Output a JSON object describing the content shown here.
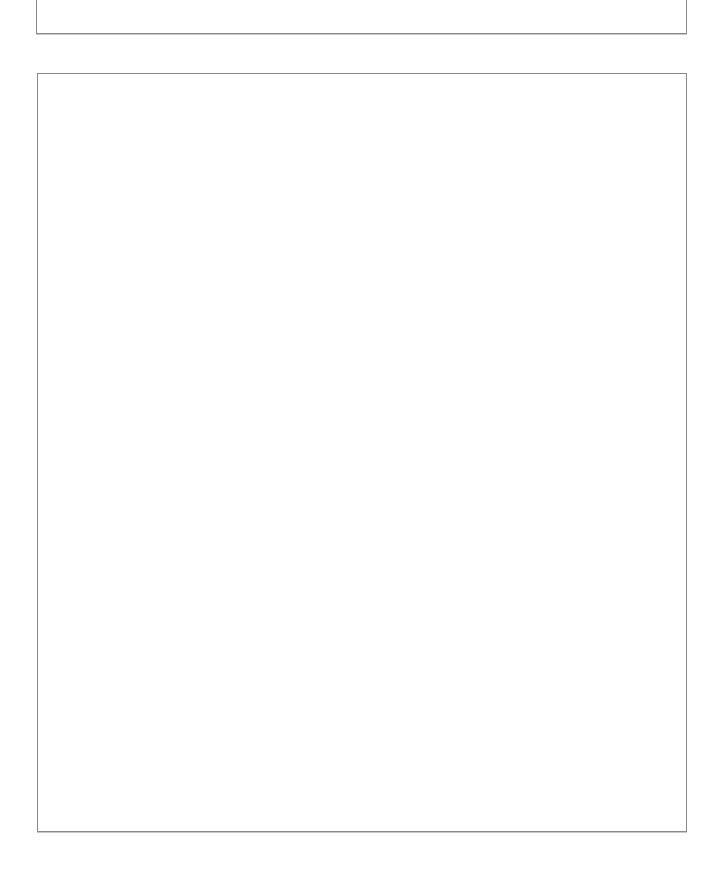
{
  "document": {
    "header_box": {
      "title": "DISCRIMINATION"
    },
    "content_box": {
      "text": ""
    }
  },
  "colors": {
    "border": "#8a8a8a",
    "text": "#1a1a1a",
    "background": "#ffffff"
  }
}
